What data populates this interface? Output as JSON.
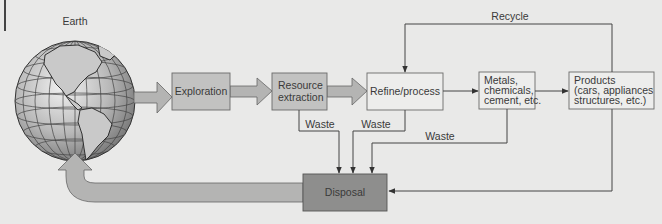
{
  "colors": {
    "background": "#e9e9e8",
    "big_arrow_fill": "#b4b4b3",
    "mid_box_fill": "#c2c2c1",
    "light_box_fill": "#ededec",
    "disposal_fill": "#8e8e8d",
    "line": "#4a4a4a"
  },
  "earth": {
    "label": "Earth"
  },
  "nodes": {
    "exploration": {
      "lines": [
        "Exploration"
      ]
    },
    "extraction": {
      "lines": [
        "Resource",
        "extraction"
      ]
    },
    "refine": {
      "lines": [
        "Refine/process"
      ]
    },
    "metals": {
      "lines": [
        "Metals,",
        "chemicals,",
        "cement, etc."
      ]
    },
    "products": {
      "lines": [
        "Products",
        "(cars, appliances",
        "structures, etc.)"
      ]
    },
    "disposal": {
      "lines": [
        "Disposal"
      ]
    }
  },
  "edges": {
    "recycle_label": "Recycle",
    "waste_extraction_label": "Waste",
    "waste_refine_label": "Waste",
    "waste_metals_label": "Waste"
  }
}
